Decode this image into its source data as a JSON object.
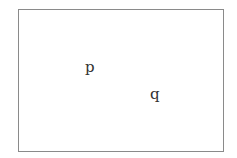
{
  "diagram": {
    "labels": {
      "p": "p",
      "q": "q"
    },
    "colors": {
      "border": "#8a8a8a",
      "text": "#333333",
      "background": "#ffffff"
    }
  }
}
